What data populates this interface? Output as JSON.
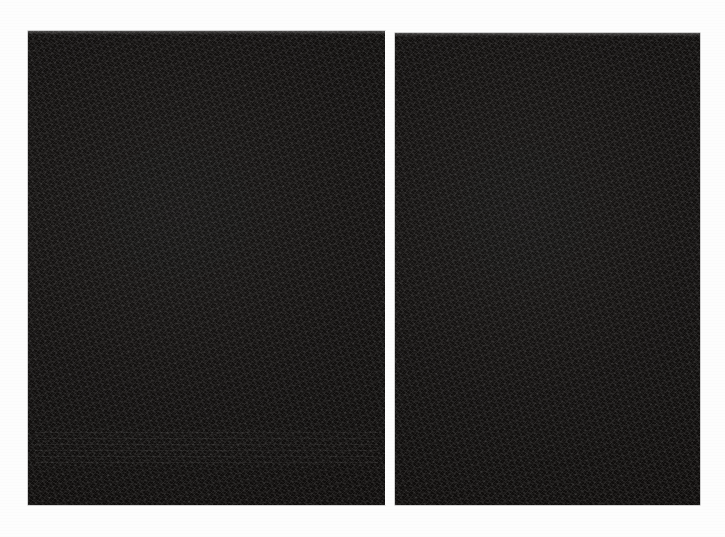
{
  "document": {
    "kind": "scanned-document-spread",
    "description": "Two facing scanned document pages, both rendered almost entirely black due to severe underexposure of the scan. No text, figures or interface elements are legible.",
    "page_count": 2,
    "background_color": "#fdfdfd",
    "page_color": "#0c0a09",
    "gutter_color": "#fdfdfd",
    "canvas": {
      "width": 725,
      "height": 537
    }
  },
  "pages": [
    {
      "id": "left-page",
      "side": "left",
      "visible_text": "",
      "legible": false,
      "geometry": {
        "left": 28,
        "top": 31,
        "width": 357,
        "height": 474
      },
      "features": {
        "top_highlight": true,
        "faint_text_band": true,
        "text_band_top": 396,
        "text_band_height": 36
      }
    },
    {
      "id": "right-page",
      "side": "right",
      "visible_text": "",
      "legible": false,
      "geometry": {
        "left": 395,
        "top": 33,
        "width": 305,
        "height": 472
      },
      "features": {
        "top_highlight": true,
        "faint_text_band": false,
        "text_band_top": 0,
        "text_band_height": 0
      }
    }
  ],
  "gutter": {
    "id": "page-gutter",
    "left": 385,
    "top": 31,
    "width": 10,
    "height": 474
  }
}
